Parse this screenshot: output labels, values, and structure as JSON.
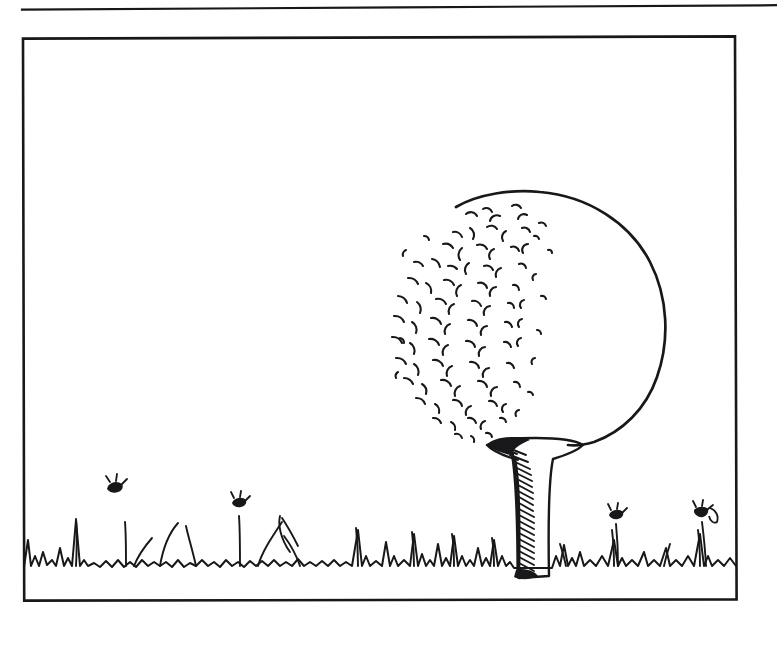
{
  "page": {
    "background_color": "#ffffff",
    "ink_color": "#18181a",
    "width": 777,
    "height": 646
  },
  "header_rule": {
    "name": "horizontal rule",
    "x1": 22,
    "y1": 9,
    "x2": 777,
    "y2": 5,
    "thickness": 2.2
  },
  "frame": {
    "name": "illustration border",
    "x": 22,
    "y": 36,
    "width": 715,
    "height": 565,
    "thickness": 2.6
  },
  "figure": {
    "caption": "",
    "style": "pen and ink line drawing"
  },
  "ball": {
    "name": "golf ball",
    "center_x": 548,
    "center_y": 320,
    "radius": 118,
    "outline_thickness": 2.6,
    "dimple_side": "left",
    "dimple_count": 128,
    "dimple_stroke": 2.0
  },
  "tee": {
    "name": "golf tee",
    "top_y": 441,
    "bottom_y": 578,
    "cup_left_x": 482,
    "cup_right_x": 583,
    "shaft_left_x": 516,
    "shaft_right_x": 548,
    "shading": "solid black cap with diagonal hatching on shaft",
    "hatch_count": 34
  },
  "ground": {
    "name": "grass line",
    "baseline_y": 565,
    "left_x": 24,
    "right_x": 736,
    "blade_count": 96,
    "stroke": 2.0
  },
  "flowers": [
    {
      "name": "flower-stem-1",
      "base_x": 126,
      "head_x": 114,
      "head_y": 487
    },
    {
      "name": "flower-stem-2",
      "base_x": 240,
      "head_x": 239,
      "head_y": 502
    },
    {
      "name": "flower-stem-3",
      "base_x": 318,
      "head_x": 282,
      "head_y": 516
    },
    {
      "name": "flower-stem-4",
      "base_x": 618,
      "head_x": 616,
      "head_y": 514
    },
    {
      "name": "flower-stem-5",
      "base_x": 706,
      "head_x": 701,
      "head_y": 511
    }
  ]
}
